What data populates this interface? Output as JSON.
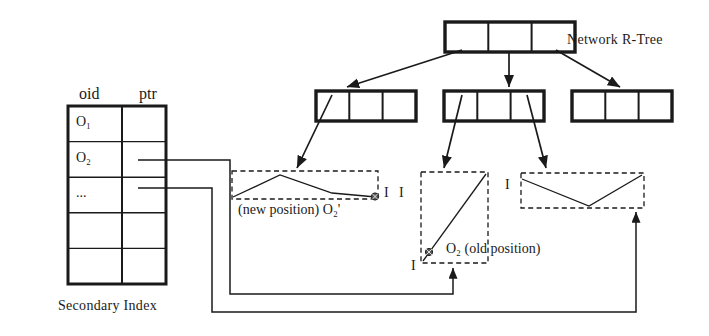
{
  "figure": {
    "domain_label": "network-r-tree-secondary-index-diagram",
    "background": "#ffffff",
    "stroke": "#1a1a1a"
  },
  "labels": {
    "network_rtree": "Network R-Tree",
    "secondary_index": "Secondary Index",
    "new_position": "(new position) O₂'",
    "old_position": "O₂ (old position)",
    "interval_left": "I",
    "interval_mid_top": "I",
    "interval_mid_bottom": "I",
    "interval_right": "I"
  },
  "table": {
    "name": "secondary-index-table",
    "headers": [
      "oid",
      "ptr"
    ],
    "rows": [
      {
        "oid": "O₁",
        "ptr": ""
      },
      {
        "oid": "O₂",
        "ptr": ""
      },
      {
        "oid": "...",
        "ptr": ""
      },
      {
        "oid": "",
        "ptr": ""
      },
      {
        "oid": "",
        "ptr": ""
      }
    ],
    "geometry": {
      "x": 68,
      "y": 106,
      "width": 98,
      "height": 178,
      "col_split": 122,
      "row_height": 35.6
    }
  },
  "tree": {
    "root": {
      "name": "root-node",
      "cells": 3,
      "x": 445,
      "y": 22,
      "width": 130,
      "height": 30
    },
    "children": [
      {
        "name": "internal-node-left",
        "cells": 3,
        "x": 316,
        "y": 91,
        "width": 100,
        "height": 30
      },
      {
        "name": "internal-node-mid",
        "cells": 3,
        "x": 444,
        "y": 91,
        "width": 100,
        "height": 30
      },
      {
        "name": "internal-node-right",
        "cells": 3,
        "x": 572,
        "y": 91,
        "width": 100,
        "height": 30
      }
    ]
  },
  "leaf_regions": [
    {
      "name": "leaf-region-new-position",
      "x": 232,
      "y": 171,
      "width": 146,
      "height": 28,
      "shape": "polyline",
      "points": "0,26 48,4 100,22 143,26",
      "marker": {
        "x": 143,
        "y": 26
      }
    },
    {
      "name": "leaf-region-old-position",
      "x": 421,
      "y": 172,
      "width": 67,
      "height": 91,
      "shape": "diagonal",
      "points": "2,89 65,2",
      "marker": {
        "x": 8,
        "y": 80
      }
    },
    {
      "name": "leaf-region-right",
      "x": 521,
      "y": 173,
      "width": 123,
      "height": 35,
      "shape": "polyline",
      "points": "0,6 68,33 121,2",
      "marker": null
    }
  ],
  "arrows": {
    "root_to_children": [
      {
        "name": "arrow-root-to-left",
        "from": [
          462,
          49
        ],
        "to": [
          346,
          88
        ]
      },
      {
        "name": "arrow-root-to-mid",
        "from": [
          509,
          52
        ],
        "to": [
          509,
          88
        ]
      },
      {
        "name": "arrow-root-to-right",
        "from": [
          556,
          49
        ],
        "to": [
          620,
          88
        ]
      }
    ],
    "children_to_leaves": [
      {
        "name": "arrow-left-node-to-new-position",
        "from": [
          330,
          94
        ],
        "to": [
          296,
          169
        ]
      },
      {
        "name": "arrow-mid-node-to-old-position",
        "from": [
          462,
          94
        ],
        "to": [
          443,
          169
        ]
      },
      {
        "name": "arrow-mid-node-to-right-region",
        "from": [
          528,
          94
        ],
        "to": [
          546,
          169
        ]
      }
    ],
    "pointer_links": [
      {
        "name": "pointer-link-o2-to-old-position",
        "target": [
          453,
          266
        ]
      },
      {
        "name": "pointer-link-o3-to-right-region",
        "target": [
          636,
          210
        ]
      }
    ]
  }
}
